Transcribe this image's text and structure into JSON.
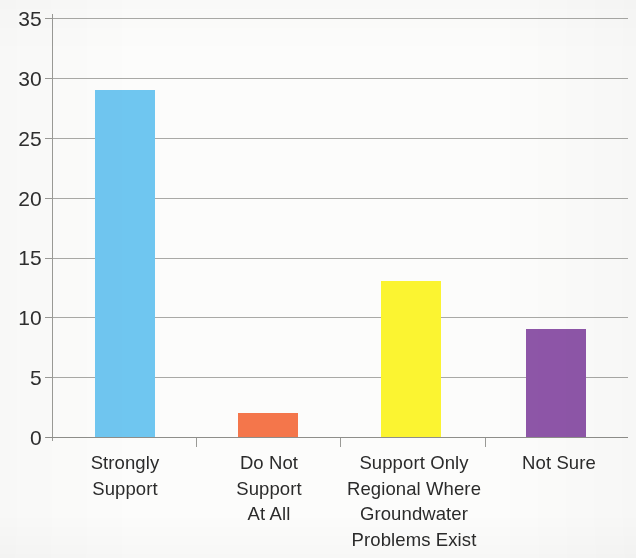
{
  "chart_data": {
    "type": "bar",
    "title": "",
    "subtitle": "",
    "xlabel": "",
    "ylabel": "",
    "categories": [
      "Strongly Support",
      "Do Not Support At All",
      "Support Only Regional Where Groundwater Problems Exist",
      "Not Sure"
    ],
    "category_lines": [
      [
        "Strongly",
        "Support"
      ],
      [
        "Do Not",
        "Support",
        "At All"
      ],
      [
        "Support Only",
        "Regional Where",
        "Groundwater",
        "Problems Exist"
      ],
      [
        "Not Sure"
      ]
    ],
    "values": [
      29,
      2,
      13,
      9
    ],
    "bar_colors": [
      "#6FC6F0",
      "#F4764B",
      "#FBF431",
      "#8E56A8"
    ],
    "ylim": [
      0,
      35
    ],
    "ytick_labels": [
      "0",
      "5",
      "10",
      "15",
      "20",
      "25",
      "30",
      "35"
    ],
    "ytick_values": [
      0,
      5,
      10,
      15,
      20,
      25,
      30,
      35
    ],
    "grid": true,
    "grid_axis": "y",
    "legend": false,
    "legend_position": "none",
    "axis_line_color": "#9a9a96",
    "gridline_color": "#9a9a96",
    "background_color": "#fcfcfb",
    "text_color": "#2b2b2b"
  }
}
